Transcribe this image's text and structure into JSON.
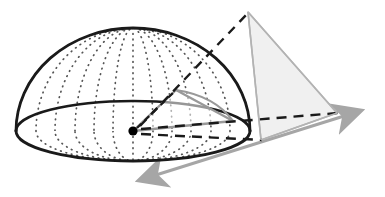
{
  "figure": {
    "type": "geometry-diagram",
    "canvas": {
      "width": 385,
      "height": 197,
      "background": "#ffffff"
    }
  },
  "colors": {
    "outline_dark": "#1a1a1a",
    "dotted_meridian": "#4d4d4d",
    "axis_gray": "#a6a6a6",
    "cone_gray": "#999999",
    "triangle_stroke": "#b3b3b3",
    "triangle_fill": "#f0f0f0",
    "cone_fill": "#e8e8e8",
    "vertex_dot": "#000000",
    "dashed_dark": "#1a1a1a"
  },
  "shapes": {
    "dome": {
      "name": "hemisphere-dome",
      "center": {
        "x": 133,
        "y": 131
      },
      "radius_x": 117,
      "radius_y": 103,
      "rim_ellipse_ry": 30,
      "stroke_width": 2.6,
      "meridian_count": 11,
      "dot_radius": 0.9
    },
    "base_rim": {
      "name": "base-ellipse",
      "cx": 133,
      "cy": 131,
      "rx": 117,
      "ry": 30
    },
    "vertex_point": {
      "name": "center-vertex",
      "x": 133,
      "y": 131,
      "radius": 4.6
    },
    "inner_cone": {
      "name": "inner-cone-wedge",
      "apex": {
        "x": 133,
        "y": 131
      },
      "edge_top": {
        "x": 176,
        "y": 90
      },
      "edge_right": {
        "x": 233,
        "y": 121
      },
      "stroke_width": 2.2
    },
    "outer_triangle": {
      "name": "projection-triangle",
      "apex": {
        "x": 248,
        "y": 12
      },
      "left_base": {
        "x": 261,
        "y": 140
      },
      "right_base": {
        "x": 337,
        "y": 113
      },
      "stroke_width": 1.6
    },
    "axis_main": {
      "name": "axis-double-arrow",
      "start": {
        "x": 136,
        "y": 182
      },
      "end": {
        "x": 364,
        "y": 110
      },
      "stroke_width": 3.0
    }
  },
  "lines": {
    "dashed_apex_ray": {
      "name": "dashed-apex-ray",
      "from": {
        "x": 133,
        "y": 131
      },
      "to": {
        "x": 248,
        "y": 12
      },
      "dash": "9 7"
    },
    "dashed_radial_short": {
      "name": "dashed-radial-short",
      "from": {
        "x": 133,
        "y": 131
      },
      "to": {
        "x": 176,
        "y": 90
      },
      "dash": "6 5"
    },
    "dashed_base_upper": {
      "name": "dashed-base-upper",
      "from": {
        "x": 139,
        "y": 128
      },
      "to": {
        "x": 338,
        "y": 113
      },
      "dash": "10 7"
    },
    "dashed_base_lower": {
      "name": "dashed-base-lower",
      "from": {
        "x": 139,
        "y": 134
      },
      "to": {
        "x": 262,
        "y": 140
      },
      "dash": "10 7"
    }
  },
  "labels": {
    "alt_text": "A hemisphere drawn with dotted meridian lines rests on an elliptical base. From a point at the center of the base, dashed lines radiate outward; a small shaded cone wedge opens toward the right. A large light-gray triangle outside the dome represents the projected area, connected to the center by a dashed line to its apex. A gray double-headed arrow passes diagonally through the base plane."
  }
}
